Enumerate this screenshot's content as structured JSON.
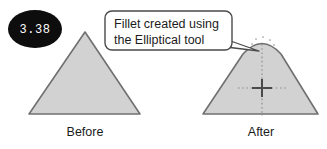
{
  "figure": {
    "background_color": "#ffffff",
    "badge": {
      "label": "3.38",
      "fill_color": "#0d0d0d",
      "text_color": "#ffffff"
    },
    "callout": {
      "line1": "Fillet created using",
      "line2": "the Elliptical tool",
      "border_color": "#4a4a4a",
      "fill_color": "#ffffff"
    },
    "shapes": {
      "outline_color": "#707070",
      "fill_color": "#d2d2d2",
      "construction_color": "#8a8a8a",
      "marker_color": "#4a4a4a",
      "before": {
        "caption": "Before",
        "apex_note": "sharp apex"
      },
      "after": {
        "caption": "After",
        "apex_note": "rounded elliptical fillet apex"
      }
    }
  }
}
